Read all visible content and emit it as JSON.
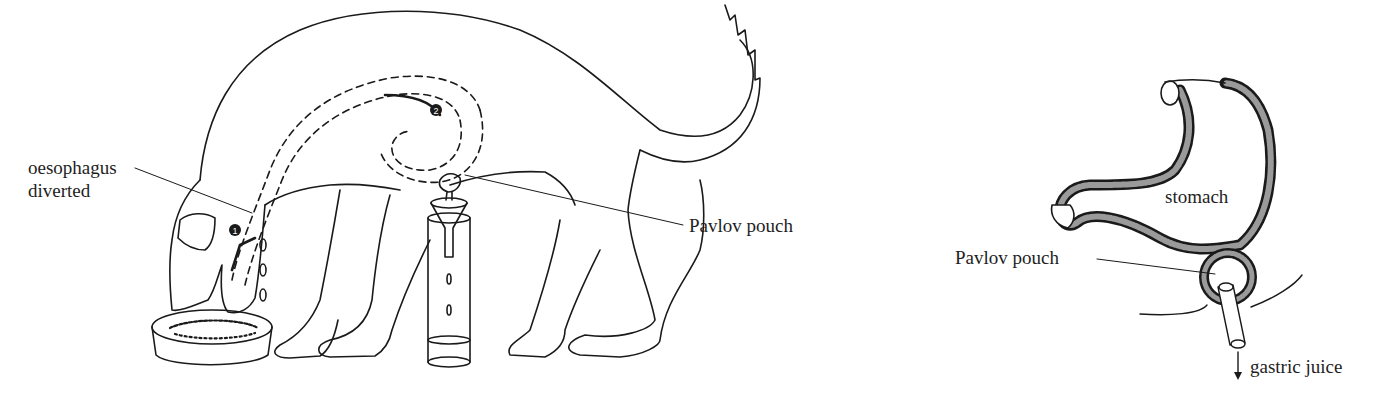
{
  "figure": {
    "left_panel": {
      "title": "Dog with diverted oesophagus and Pavlov pouch",
      "labels": {
        "oesophagus_line1": "oesophagus",
        "oesophagus_line2": "diverted",
        "pavlov_pouch": "Pavlov pouch"
      },
      "markers": {
        "step1": "1",
        "step2": "2"
      }
    },
    "right_panel": {
      "title": "Stomach with Pavlov pouch",
      "labels": {
        "stomach": "stomach",
        "pavlov_pouch": "Pavlov pouch",
        "gastric_juice": "gastric juice"
      }
    },
    "colors": {
      "ink": "#1a1a1a",
      "background": "#ffffff",
      "stomach_wall_fill": "#9a9a9a"
    }
  }
}
